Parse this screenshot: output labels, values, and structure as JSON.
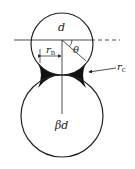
{
  "diagram": {
    "labels": {
      "top_diameter": "d",
      "angle": "θ",
      "neck_radius_main": "r",
      "neck_radius_sub": "n",
      "meniscus_radius_main": "r",
      "meniscus_radius_sub": "c",
      "bottom_diameter": "βd"
    },
    "colors": {
      "line": "#222222",
      "fill": "#111111",
      "background": "#ffffff"
    }
  }
}
